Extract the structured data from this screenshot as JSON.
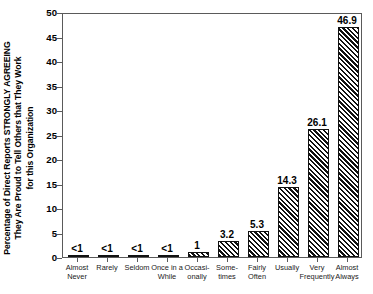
{
  "chart_data": {
    "type": "bar",
    "title": "",
    "subtitle": "",
    "xlabel": "",
    "ylabel": "Percentage of Direct Reports STRONGLY AGREEING They Are Proud to Tell Others that They Work for this Organization",
    "ylabel_lines": [
      "Percentage of Direct Reports STRONGLY AGREEING",
      "They Are Proud to Tell Others that They Work",
      "for this Organization"
    ],
    "categories": [
      "Almost Never",
      "Rarely",
      "Seldom",
      "Once in a While",
      "Occasionally",
      "Sometimes",
      "Fairly Often",
      "Usually",
      "Very Frequently",
      "Almost Always"
    ],
    "category_lines": [
      [
        "Almost",
        "Never"
      ],
      [
        "Rarely",
        ""
      ],
      [
        "Seldom",
        ""
      ],
      [
        "Once in a",
        "While"
      ],
      [
        "Occasi-",
        "onally"
      ],
      [
        "Some-",
        "times"
      ],
      [
        "Fairly",
        "Often"
      ],
      [
        "Usually",
        ""
      ],
      [
        "Very",
        "Frequently"
      ],
      [
        "Almost",
        "Always"
      ]
    ],
    "values": [
      0.4,
      0.4,
      0.4,
      0.4,
      1.0,
      3.2,
      5.3,
      14.3,
      26.1,
      46.9
    ],
    "value_labels": [
      "<1",
      "<1",
      "<1",
      "<1",
      "1",
      "3.2",
      "5.3",
      "14.3",
      "26.1",
      "46.9"
    ],
    "ylim": [
      0,
      50
    ],
    "yticks": [
      0,
      5,
      10,
      15,
      20,
      25,
      30,
      35,
      40,
      45,
      50
    ],
    "ytick_labels": [
      "0",
      "5",
      "10",
      "15",
      "20",
      "25",
      "30",
      "35",
      "40",
      "45",
      "50"
    ],
    "grid": false,
    "legend": null,
    "bar_fill": "#1a1a1a",
    "bar_pattern": "diagonal-hatch",
    "axis_color": "#5a5a5a",
    "background": "#ffffff"
  }
}
